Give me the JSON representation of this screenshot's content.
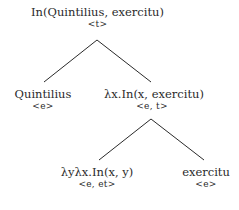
{
  "tree": {
    "root": {
      "label": "In(Quintilius, exercitu)",
      "type": "<t>"
    },
    "left": {
      "label": "Quintilius",
      "type": "<e>"
    },
    "right": {
      "label": "λx.In(x, exercitu)",
      "type": "<e, t>"
    },
    "right_left": {
      "label": "λyλx.In(x, y)",
      "type": "<e, et>"
    },
    "right_right": {
      "label": "exercitu",
      "type": "<e>"
    }
  }
}
